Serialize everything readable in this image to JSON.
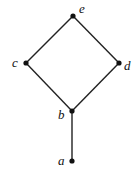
{
  "diagram": {
    "type": "hasse",
    "nodes": [
      {
        "id": "e",
        "label": "e",
        "x": 73,
        "y": 16,
        "lx": 79,
        "ly": 13
      },
      {
        "id": "c",
        "label": "c",
        "x": 26,
        "y": 63,
        "lx": 12,
        "ly": 67
      },
      {
        "id": "d",
        "label": "d",
        "x": 119,
        "y": 63,
        "lx": 124,
        "ly": 70
      },
      {
        "id": "b",
        "label": "b",
        "x": 72,
        "y": 111,
        "lx": 58,
        "ly": 119
      },
      {
        "id": "a",
        "label": "a",
        "x": 72,
        "y": 161,
        "lx": 58,
        "ly": 165
      }
    ],
    "edges": [
      [
        "e",
        "c"
      ],
      [
        "e",
        "d"
      ],
      [
        "c",
        "b"
      ],
      [
        "d",
        "b"
      ],
      [
        "b",
        "a"
      ]
    ],
    "line_color": "#222222",
    "node_color": "#111111"
  }
}
